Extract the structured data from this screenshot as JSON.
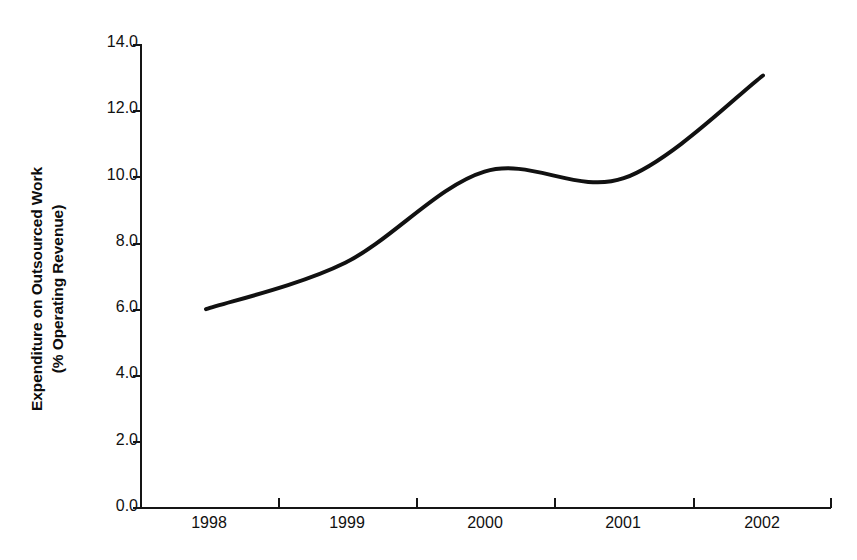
{
  "chart_data": {
    "type": "line",
    "title": "",
    "subtitle": "",
    "xlabel": "",
    "ylabel": "Expenditure on Outsourced Work (% Operating Revenue)",
    "ylabel_lines": [
      "Expenditure on Outsourced Work",
      "(% Operating Revenue)"
    ],
    "categories": [
      "1998",
      "1999",
      "2000",
      "2001",
      "2002"
    ],
    "x": [
      1998,
      1999,
      2000,
      2001,
      2002
    ],
    "values": [
      6.0,
      7.4,
      10.15,
      9.95,
      13.05
    ],
    "series": [
      {
        "name": "Expenditure on Outsourced Work",
        "values": [
          6.0,
          7.4,
          10.15,
          9.95,
          13.05
        ],
        "color": "#111111",
        "line_width": 4,
        "smoothing": "spline",
        "markers": "none"
      }
    ],
    "ylim": [
      0.0,
      14.0
    ],
    "ytick_values": [
      0.0,
      2.0,
      4.0,
      6.0,
      8.0,
      10.0,
      12.0,
      14.0
    ],
    "ytick_labels": [
      "0.0",
      "2.0",
      "4.0",
      "6.0",
      "8.0",
      "10.0",
      "12.0",
      "14.0"
    ],
    "xtick_labels": [
      "1998",
      "1999",
      "2000",
      "2001",
      "2002"
    ],
    "xtick_label_position": "between-ticks",
    "grid": false,
    "legend": "none",
    "legend_position": "none",
    "annotations": [],
    "background_color": "#ffffff",
    "axis_color": "#151515"
  },
  "figure": {
    "width": 857,
    "height": 560
  }
}
